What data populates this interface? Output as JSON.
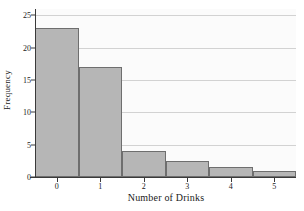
{
  "chart_data": {
    "type": "bar",
    "title": "",
    "subtitle": "",
    "xlabel": "Number of Drinks",
    "ylabel": "Frequency",
    "categories": [
      "0",
      "1",
      "2",
      "3",
      "4",
      "5"
    ],
    "values": [
      23,
      17,
      4,
      2.5,
      1.5,
      1
    ],
    "series": [
      {
        "name": "Frequency",
        "values": [
          23,
          17,
          4,
          2.5,
          1.5,
          1
        ]
      }
    ],
    "xlim": [
      -0.5,
      5.5
    ],
    "ylim": [
      0,
      26
    ],
    "yticks": [
      0,
      5,
      10,
      15,
      20,
      25
    ],
    "ytick_labels": [
      "0",
      "5",
      "10",
      "15",
      "20",
      "25"
    ],
    "xticks": [
      0,
      1,
      2,
      3,
      4,
      5
    ],
    "xtick_labels": [
      "0",
      "1",
      "2",
      "3",
      "4",
      "5"
    ],
    "grid": true,
    "grid_axis": "y",
    "legend": false,
    "legend_position": "none",
    "bar_fill_color": "#b6b6b6",
    "bar_edge_color": "#6e6e6e",
    "panel_background": "#fbfbfb",
    "gridline_color": "#d2d2d2",
    "axis_color": "#3a3a3a",
    "bar_width": 1.0,
    "annotations": []
  }
}
